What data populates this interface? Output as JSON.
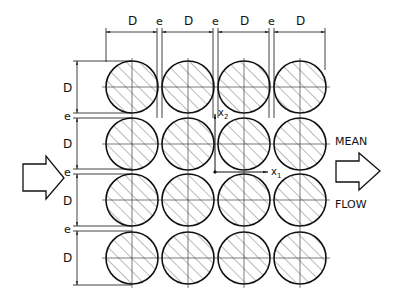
{
  "diagram": {
    "grid": {
      "rows": 4,
      "cols": 4
    },
    "colors": {
      "stroke": "#111111",
      "hatch": "#555555",
      "background": "#ffffff"
    },
    "dimensions": {
      "top": [
        "D",
        "e",
        "D",
        "e",
        "D",
        "e",
        "D"
      ],
      "left": [
        "D",
        "e",
        "D",
        "e",
        "D",
        "e",
        "D"
      ]
    },
    "labels": {
      "diameter": "D",
      "gap": "e",
      "axis_x": "x",
      "axis_x_sub": "1",
      "axis_y": "x",
      "axis_y_sub": "2",
      "flow_top": "MEAN",
      "flow_bottom": "FLOW"
    },
    "icons": {
      "inlet": "right-arrow-outline",
      "outlet": "right-arrow-outline"
    }
  }
}
